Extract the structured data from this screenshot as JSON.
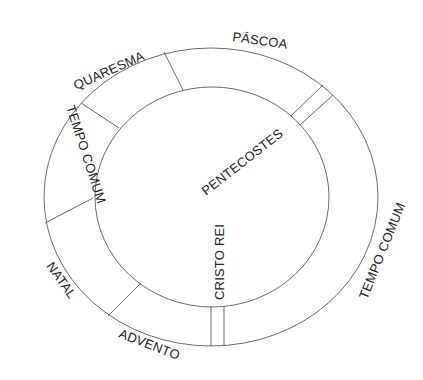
{
  "diagram": {
    "colors": {
      "stroke": "#6b6b6b",
      "text": "#222222",
      "background": "#ffffff"
    },
    "rings": {
      "outer": {
        "cx": 211,
        "cy": 197,
        "rx": 167,
        "ry": 149
      },
      "inner": {
        "cx": 212,
        "cy": 197,
        "rx": 117,
        "ry": 110
      }
    },
    "seasons": [
      {
        "id": "pascoa",
        "label": "PÁSCOA"
      },
      {
        "id": "quaresma",
        "label": "QUARESMA"
      },
      {
        "id": "tempo-comum-1",
        "label": "TEMPO COMUM"
      },
      {
        "id": "natal",
        "label": "NATAL"
      },
      {
        "id": "advento",
        "label": "ADVENTO"
      },
      {
        "id": "tempo-comum-2",
        "label": "TEMPO COMUM"
      }
    ],
    "feasts": [
      {
        "id": "pentecostes",
        "label": "PENTECOSTES"
      },
      {
        "id": "cristo-rei",
        "label": "CRISTO REI"
      }
    ]
  }
}
